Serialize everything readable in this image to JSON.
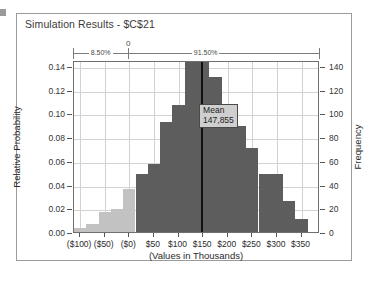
{
  "window": {
    "title": "Simulation Results - $C$21"
  },
  "certainty_band": {
    "zero_label": "0",
    "left_segment_label": "8.50%",
    "right_segment_label": "91.50%"
  },
  "mean_marker": {
    "label": "Mean",
    "value": "147,855"
  },
  "colors": {
    "bar_left": "#c2c2c2",
    "bar_right": "#5d5d5d",
    "mean_line": "#101010",
    "frame": "#6f6f6f",
    "grid": "#d2d2d2"
  },
  "chart_data": {
    "type": "bar",
    "title": "Simulation Results - $C$21",
    "xlabel": "(Values in Thousands)",
    "ylabel": "Relative Probability",
    "ylabel_secondary": "Frequency",
    "grid": true,
    "legend": "none",
    "ylim": [
      0.0,
      0.145
    ],
    "ylim_secondary": [
      0,
      145
    ],
    "yticks": [
      "0.00",
      "0.02",
      "0.04",
      "0.06",
      "0.08",
      "0.10",
      "0.12",
      "0.14"
    ],
    "ytick_values": [
      0.0,
      0.02,
      0.04,
      0.06,
      0.08,
      0.1,
      0.12,
      0.14
    ],
    "yticks_secondary": [
      "0",
      "20",
      "40",
      "60",
      "80",
      "100",
      "120",
      "140"
    ],
    "ytick_values_secondary": [
      0,
      20,
      40,
      60,
      80,
      100,
      120,
      140
    ],
    "xticks": [
      "($100)",
      "($50)",
      "($0)",
      "$50",
      "$100",
      "$150",
      "$200",
      "$250",
      "$300",
      "$350"
    ],
    "xtick_values": [
      -100,
      -50,
      0,
      50,
      100,
      150,
      200,
      250,
      300,
      350
    ],
    "xlim": [
      -112.5,
      387.5
    ],
    "bin_width": 25,
    "bins": [
      {
        "center": -100,
        "relative_probability": 0.003,
        "frequency": 3,
        "side": "left"
      },
      {
        "center": -75,
        "relative_probability": 0.007,
        "frequency": 7,
        "side": "left"
      },
      {
        "center": -50,
        "relative_probability": 0.017,
        "frequency": 17,
        "side": "left"
      },
      {
        "center": -25,
        "relative_probability": 0.019,
        "frequency": 19,
        "side": "left"
      },
      {
        "center": 0,
        "relative_probability": 0.036,
        "frequency": 36,
        "side": "left"
      },
      {
        "center": 25,
        "relative_probability": 0.049,
        "frequency": 49,
        "side": "right"
      },
      {
        "center": 50,
        "relative_probability": 0.057,
        "frequency": 57,
        "side": "right"
      },
      {
        "center": 75,
        "relative_probability": 0.093,
        "frequency": 93,
        "side": "right"
      },
      {
        "center": 100,
        "relative_probability": 0.107,
        "frequency": 107,
        "side": "right"
      },
      {
        "center": 125,
        "relative_probability": 0.145,
        "frequency": 145,
        "side": "right"
      },
      {
        "center": 150,
        "relative_probability": 0.145,
        "frequency": 145,
        "side": "right"
      },
      {
        "center": 175,
        "relative_probability": 0.131,
        "frequency": 131,
        "side": "right"
      },
      {
        "center": 200,
        "relative_probability": 0.104,
        "frequency": 104,
        "side": "right"
      },
      {
        "center": 225,
        "relative_probability": 0.089,
        "frequency": 89,
        "side": "right"
      },
      {
        "center": 250,
        "relative_probability": 0.071,
        "frequency": 71,
        "side": "right"
      },
      {
        "center": 275,
        "relative_probability": 0.049,
        "frequency": 49,
        "side": "right"
      },
      {
        "center": 300,
        "relative_probability": 0.049,
        "frequency": 49,
        "side": "right"
      },
      {
        "center": 325,
        "relative_probability": 0.026,
        "frequency": 26,
        "side": "right"
      },
      {
        "center": 350,
        "relative_probability": 0.011,
        "frequency": 11,
        "side": "right"
      }
    ],
    "annotations": [
      {
        "name": "mean-line",
        "x": 147.855,
        "label": "Mean",
        "value": "147,855"
      },
      {
        "name": "certainty-left",
        "label": "8.50%"
      },
      {
        "name": "certainty-right",
        "label": "91.50%"
      },
      {
        "name": "certainty-zero",
        "label": "0",
        "x": 0
      }
    ]
  }
}
